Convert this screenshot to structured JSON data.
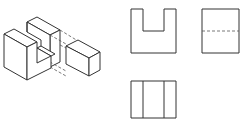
{
  "diagram": {
    "type": "orthographic-projection",
    "views": [
      {
        "name": "isometric",
        "description": "U-shaped block with separated rectangular block, hidden lines showing fit"
      },
      {
        "name": "front-view",
        "description": "Rectangle with U-shaped notch at top"
      },
      {
        "name": "side-view",
        "description": "Rectangle with dashed hidden line across middle"
      },
      {
        "name": "top-view",
        "description": "Rectangle divided by two vertical lines"
      }
    ],
    "colors": {
      "line": "#333333",
      "background": "#ffffff"
    }
  }
}
